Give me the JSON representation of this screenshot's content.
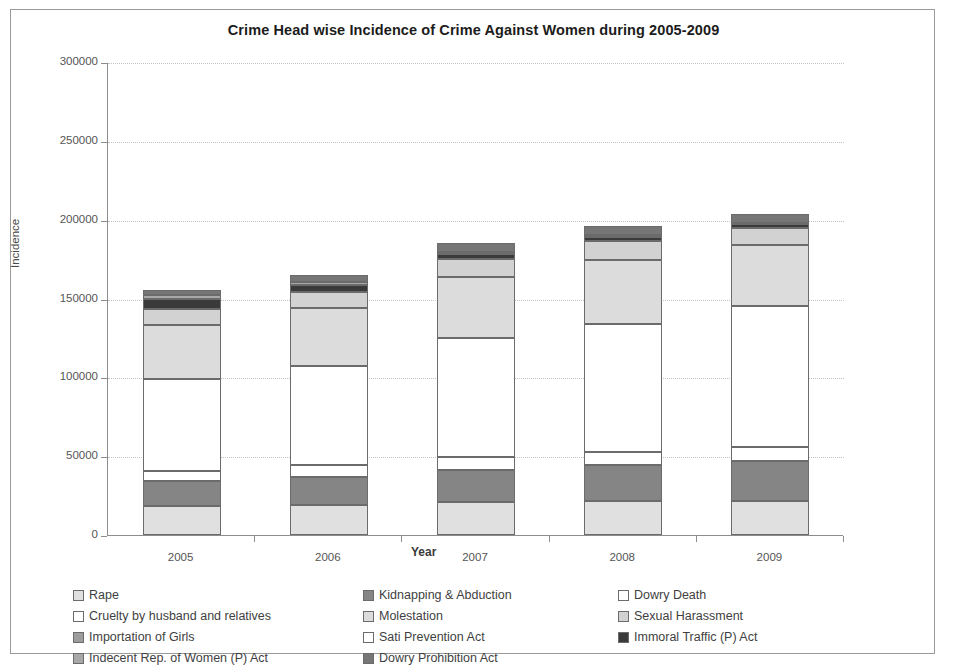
{
  "chart_data": {
    "type": "bar",
    "subtype": "stacked-column",
    "title": "Crime Head wise Incidence of Crime Against Women during 2005-2009",
    "xlabel": "Year",
    "ylabel": "Incidence",
    "categories": [
      "2005",
      "2006",
      "2007",
      "2008",
      "2009"
    ],
    "ylim": [
      0,
      300000
    ],
    "ytick_labels": [
      "0",
      "50000",
      "100000",
      "150000",
      "200000",
      "250000",
      "300000"
    ],
    "ytick_values": [
      0,
      50000,
      100000,
      150000,
      200000,
      250000,
      300000
    ],
    "grid": true,
    "legend_position": "bottom",
    "series": [
      {
        "name": "Rape",
        "color": "#e0e0e0",
        "values": [
          18359,
          19348,
          20737,
          21467,
          21397
        ]
      },
      {
        "name": "Kidnapping & Abduction",
        "color": "#858585",
        "values": [
          15750,
          17414,
          20416,
          22939,
          25741
        ]
      },
      {
        "name": "Dowry Death",
        "color": "#ffffff",
        "values": [
          6787,
          7618,
          8093,
          8172,
          8383
        ]
      },
      {
        "name": "Cruelty by husband and relatives",
        "color": "#ffffff",
        "values": [
          58319,
          63128,
          75930,
          81344,
          89546
        ]
      },
      {
        "name": "Molestation",
        "color": "#dcdcdc",
        "values": [
          34175,
          36617,
          38734,
          40413,
          38711
        ]
      },
      {
        "name": "Sexual Harassment",
        "color": "#d2d2d2",
        "values": [
          9984,
          9966,
          10950,
          12214,
          11009
        ]
      },
      {
        "name": "Importation of Girls",
        "color": "#9d9d9d",
        "values": [
          149,
          67,
          61,
          67,
          48
        ]
      },
      {
        "name": "Sati Prevention Act",
        "color": "#ffffff",
        "values": [
          1,
          0,
          0,
          1,
          0
        ]
      },
      {
        "name": "Immoral Traffic (P) Act",
        "color": "#3a3a3a",
        "values": [
          5908,
          4541,
          3568,
          2659,
          2474
        ]
      },
      {
        "name": "Indecent Rep. of Women (P) Act",
        "color": "#a8a8a8",
        "values": [
          2917,
          1562,
          1200,
          1025,
          845
        ]
      },
      {
        "name": "Dowry Prohibition Act",
        "color": "#767676",
        "values": [
          3204,
          4504,
          5623,
          5555,
          5650
        ]
      }
    ],
    "totals": [
      155553,
      164765,
      185312,
      195856,
      203804
    ]
  },
  "legend": {
    "rows": [
      [
        "Rape",
        "Kidnapping & Abduction",
        "Dowry Death"
      ],
      [
        "Cruelty by husband and relatives",
        "Molestation",
        "Sexual Harassment"
      ],
      [
        "Importation of Girls",
        "Sati Prevention Act",
        "Immoral Traffic (P) Act"
      ],
      [
        "Indecent Rep. of Women (P) Act",
        "Dowry Prohibition Act"
      ]
    ]
  }
}
